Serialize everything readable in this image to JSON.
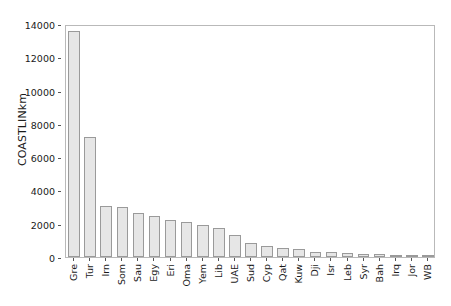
{
  "chart_data": {
    "type": "bar",
    "title": "",
    "xlabel": "",
    "ylabel": "COASTLINkm",
    "ylim": [
      0,
      14000
    ],
    "yticks": [
      0,
      2000,
      4000,
      6000,
      8000,
      10000,
      12000,
      14000
    ],
    "ytick_labels": [
      "0",
      "2000",
      "4000",
      "6000",
      "8000",
      "10000",
      "12000",
      "14000"
    ],
    "grid": false,
    "legend": null,
    "bar_color": "#e6e6e6",
    "bar_edge_color": "#9a9a9a",
    "frame_color": "#b9b9b9",
    "categories": [
      "Gre",
      "Tur",
      "Irn",
      "Som",
      "Sau",
      "Egy",
      "Eri",
      "Oma",
      "Yem",
      "Lib",
      "UAE",
      "Sud",
      "Cyp",
      "Qat",
      "Kuw",
      "Dji",
      "Isr",
      "Leb",
      "Syr",
      "Bah",
      "Irq",
      "Jor",
      "WB"
    ],
    "values": [
      13576,
      7200,
      3060,
      3025,
      2640,
      2450,
      2234,
      2092,
      1906,
      1770,
      1318,
      853,
      648,
      563,
      499,
      314,
      273,
      225,
      193,
      161,
      58,
      26,
      40
    ]
  }
}
